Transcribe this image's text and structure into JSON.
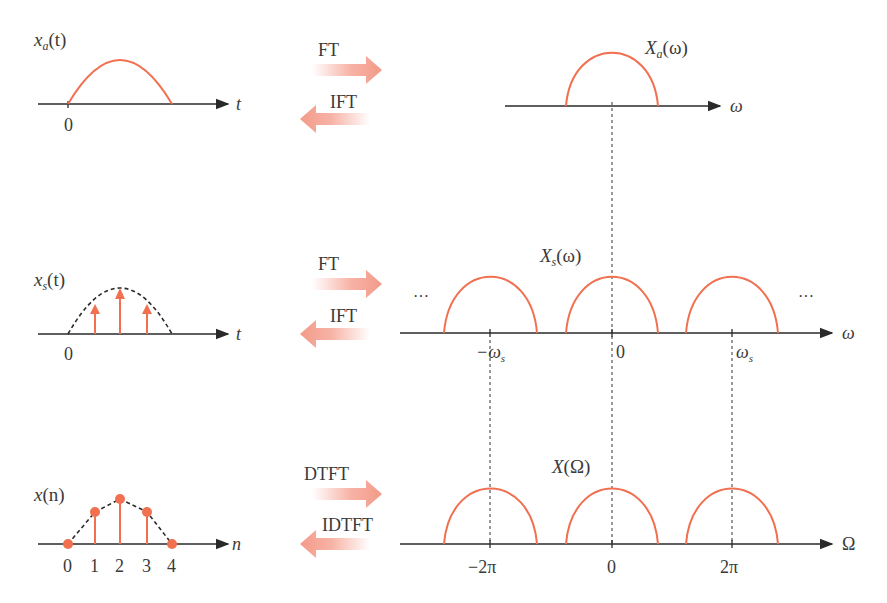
{
  "colors": {
    "curve": "#f07050",
    "axis": "#2a2a2a",
    "arrow": "#f5a090",
    "text": "#3a3a3a",
    "dashed": "#333333"
  },
  "rows": [
    {
      "id": "continuous",
      "left": {
        "signal_label": "x",
        "signal_sub": "a",
        "signal_arg": "(t)",
        "axis_var": "t",
        "origin": "0"
      },
      "forward": "FT",
      "inverse": "IFT",
      "right": {
        "spectrum_label": "X",
        "spectrum_sub": "a",
        "spectrum_arg": "(ω)",
        "axis_var": "ω"
      }
    },
    {
      "id": "sampled",
      "left": {
        "signal_label": "x",
        "signal_sub": "s",
        "signal_arg": "(t)",
        "axis_var": "t",
        "origin": "0"
      },
      "forward": "FT",
      "inverse": "IFT",
      "right": {
        "spectrum_label": "X",
        "spectrum_sub": "s",
        "spectrum_arg": "(ω)",
        "axis_var": "ω",
        "ellipsis": "···",
        "ticks": [
          {
            "label": "−ω",
            "sub": "s"
          },
          {
            "label": "0",
            "sub": ""
          },
          {
            "label": "ω",
            "sub": "s"
          }
        ]
      }
    },
    {
      "id": "discrete",
      "left": {
        "signal_label": "x",
        "signal_arg": "(n)",
        "axis_var": "n",
        "ticks": [
          "0",
          "1",
          "2",
          "3",
          "4"
        ]
      },
      "forward": "DTFT",
      "inverse": "IDTFT",
      "right": {
        "spectrum_label": "X",
        "spectrum_arg": "(Ω)",
        "axis_var": "Ω",
        "ticks": [
          "−2π",
          "0",
          "2π"
        ]
      }
    }
  ]
}
